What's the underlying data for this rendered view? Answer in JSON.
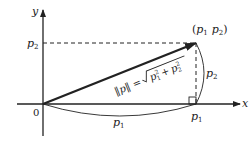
{
  "diagram": {
    "axes": {
      "x_label": "x",
      "y_label": "y",
      "origin_label": "0"
    },
    "point": {
      "label_open": "(",
      "label_p1": "p",
      "label_p1_sub": "1",
      "label_p2": "p",
      "label_p2_sub": "2",
      "label_close": ")"
    },
    "tick_labels": {
      "y_tick": "p",
      "y_tick_sub": "2",
      "x_tick": "p",
      "x_tick_sub": "1"
    },
    "arc_labels": {
      "bottom": "p",
      "bottom_sub": "1",
      "right": "p",
      "right_sub": "2"
    },
    "formula": {
      "lhs": "‖p‖ =",
      "radicand_a": "p",
      "radicand_a_sub": "1",
      "radicand_a_sup": "2",
      "plus": "+",
      "radicand_b": "p",
      "radicand_b_sub": "2",
      "radicand_b_sup": "2"
    },
    "colors": {
      "stroke": "#222222",
      "background": "#ffffff"
    }
  }
}
